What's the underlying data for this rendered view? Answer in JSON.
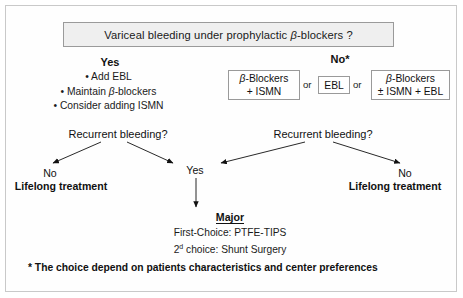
{
  "title": {
    "text": "Variceal bleeding under prophylactic β-blockers ?"
  },
  "branches": {
    "yes_label": "Yes",
    "no_label": "No*"
  },
  "yes_branch": {
    "bullets": [
      "• Add EBL",
      "• Maintain β-blockers",
      "• Consider adding ISMN"
    ]
  },
  "no_branch": {
    "options": [
      {
        "line1": "β-Blockers",
        "line2": "+ ISMN"
      },
      {
        "line1": "EBL",
        "line2": ""
      },
      {
        "line1": "β-Blockers",
        "line2": "± ISMN + EBL"
      }
    ],
    "connector_1": "or",
    "connector_2": "or"
  },
  "decisions": {
    "left": "Recurrent bleeding?",
    "right": "Recurrent bleeding?"
  },
  "outcomes": {
    "left_no": "No",
    "left_lifelong": "Lifelong treatment",
    "right_no": "No",
    "right_lifelong": "Lifelong treatment",
    "center_yes": "Yes"
  },
  "major": {
    "heading": "Major",
    "first_choice": "First-Choice: PTFE-TIPS",
    "second_choice_prefix": "2",
    "second_choice_sup": "d",
    "second_choice_rest": " choice: Shunt Surgery"
  },
  "footnote": {
    "text": "* The choice depend on patients characteristics and center preferences"
  },
  "colors": {
    "title_fill": "#efefef",
    "border": "#9a9a9a",
    "frame": "#c9c9c9",
    "text": "#111111",
    "background": "#ffffff"
  }
}
